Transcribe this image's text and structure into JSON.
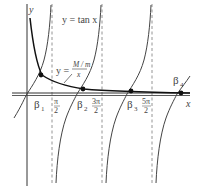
{
  "figure": {
    "curves": {
      "tan_label": "y = tan x",
      "hyperbola_label_prefix": "y =",
      "hyperbola_numerator": "M / m",
      "hyperbola_denominator": "x"
    },
    "axes": {
      "x_label": "x",
      "y_label": "y"
    },
    "asymptote_labels": [
      {
        "num": "π",
        "den": "2"
      },
      {
        "num": "3π",
        "den": "2"
      },
      {
        "num": "5π",
        "den": "2"
      }
    ],
    "roots": [
      {
        "label": "β",
        "sub": "1"
      },
      {
        "label": "β",
        "sub": "2"
      },
      {
        "label": "β",
        "sub": "3"
      },
      {
        "label": "β",
        "sub": "4"
      }
    ],
    "colors": {
      "curve": "#222222",
      "axis": "#333333",
      "asymptote": "#888888",
      "text": "#444444"
    }
  }
}
